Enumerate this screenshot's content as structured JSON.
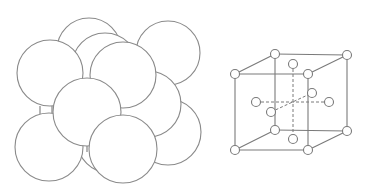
{
  "diagram": {
    "left_panel": {
      "label": "hard-sphere packing model",
      "stroke_color": "#8a8a8a",
      "spheres": [
        {
          "id": "back-top-middle",
          "cx": 89,
          "cy": 50,
          "r": 32
        },
        {
          "id": "back-top-right",
          "cx": 168,
          "cy": 53,
          "r": 32
        },
        {
          "id": "back-center",
          "cx": 105,
          "cy": 66,
          "r": 33
        },
        {
          "id": "back-bottom-right",
          "cx": 168,
          "cy": 132,
          "r": 33
        },
        {
          "id": "back-bottom-middle",
          "cx": 110,
          "cy": 140,
          "r": 33
        },
        {
          "id": "right-middle",
          "cx": 148,
          "cy": 104,
          "r": 33
        },
        {
          "id": "left-top",
          "cx": 50,
          "cy": 73,
          "r": 33
        },
        {
          "id": "left-bottom",
          "cx": 49,
          "cy": 147,
          "r": 34
        },
        {
          "id": "top-center-front",
          "cx": 123,
          "cy": 75,
          "r": 33
        },
        {
          "id": "center-front",
          "cx": 87,
          "cy": 112,
          "r": 34
        },
        {
          "id": "bottom-center-front",
          "cx": 123,
          "cy": 149,
          "r": 34
        }
      ]
    },
    "right_panel": {
      "label": "unit cell lattice model",
      "stroke_color": "#7a7a7a",
      "atom_radius": 4.5,
      "corners": [
        {
          "id": "front-top-left",
          "x": 235,
          "y": 74
        },
        {
          "id": "front-top-right",
          "x": 308,
          "y": 74
        },
        {
          "id": "front-bottom-left",
          "x": 235,
          "y": 150
        },
        {
          "id": "front-bottom-right",
          "x": 308,
          "y": 150
        },
        {
          "id": "back-top-left",
          "x": 275,
          "y": 54
        },
        {
          "id": "back-top-right",
          "x": 347,
          "y": 55
        },
        {
          "id": "back-bottom-left",
          "x": 275,
          "y": 130
        },
        {
          "id": "back-bottom-right",
          "x": 347,
          "y": 131
        }
      ],
      "face_centers": [
        {
          "id": "top",
          "x": 293,
          "y": 64
        },
        {
          "id": "bottom",
          "x": 293,
          "y": 139
        },
        {
          "id": "left",
          "x": 256,
          "y": 102
        },
        {
          "id": "right",
          "x": 329,
          "y": 102
        },
        {
          "id": "back",
          "x": 312,
          "y": 93
        },
        {
          "id": "front",
          "x": 271,
          "y": 112
        }
      ]
    }
  }
}
